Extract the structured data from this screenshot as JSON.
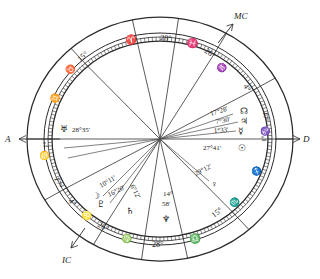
{
  "chart": {
    "kind": "astrological-natal-chart",
    "style": "hand-drawn-ink",
    "title": "",
    "axes": [
      {
        "id": "ascendant",
        "label": "A",
        "side": "left",
        "arrow": "left"
      },
      {
        "id": "descendant",
        "label": "D",
        "side": "right",
        "arrow": "right"
      },
      {
        "id": "midheaven",
        "label": "MC",
        "side": "upper-right",
        "arrow": "up-right"
      },
      {
        "id": "imum-coeli",
        "label": "IC",
        "side": "lower-left",
        "arrow": "down-left"
      }
    ],
    "house_cusps": [
      {
        "house": 1,
        "degree": "1°",
        "sign_glyph": "♋",
        "sign_name": "Cancer"
      },
      {
        "house": 2,
        "degree": "17°",
        "sign_glyph": "♌",
        "sign_name": "Leo"
      },
      {
        "house": 3,
        "degree": "4°",
        "sign_glyph": "♌",
        "sign_name": "Leo"
      },
      {
        "house": 4,
        "degree": "26°",
        "sign_glyph": "♍",
        "sign_name": "Virgo"
      },
      {
        "house": 5,
        "degree": "28°",
        "sign_glyph": "♎",
        "sign_name": "Libra"
      },
      {
        "house": 6,
        "degree": "15°",
        "sign_glyph": "♏",
        "sign_name": "Scorpio"
      },
      {
        "house": 7,
        "degree": "1°",
        "sign_glyph": "♑",
        "sign_name": "Capricorn"
      },
      {
        "house": 8,
        "degree": "17°",
        "sign_glyph": "♑",
        "sign_name": "Capricorn"
      },
      {
        "house": 9,
        "degree": "4°",
        "sign_glyph": "♒",
        "sign_name": "Aquarius"
      },
      {
        "house": 10,
        "degree": "26°",
        "sign_glyph": "♒",
        "sign_name": "Aquarius"
      },
      {
        "house": 11,
        "degree": "28°",
        "sign_glyph": "♓",
        "sign_name": "Pisces"
      },
      {
        "house": 12,
        "degree": "15°",
        "sign_glyph": "♉",
        "sign_name": "Taurus"
      }
    ],
    "wheel_sign_glyphs": [
      {
        "glyph": "♈",
        "name": "Aries"
      },
      {
        "glyph": "♓",
        "name": "Pisces"
      },
      {
        "glyph": "♒",
        "name": "Aquarius"
      },
      {
        "glyph": "♑",
        "name": "Capricorn"
      },
      {
        "glyph": "♐",
        "name": "Sagittarius"
      },
      {
        "glyph": "♏",
        "name": "Scorpio"
      },
      {
        "glyph": "♎",
        "name": "Libra"
      },
      {
        "glyph": "♍",
        "name": "Virgo"
      },
      {
        "glyph": "♌",
        "name": "Leo"
      },
      {
        "glyph": "♋",
        "name": "Cancer"
      },
      {
        "glyph": "♊",
        "name": "Gemini"
      },
      {
        "glyph": "♉",
        "name": "Taurus"
      }
    ],
    "planets": [
      {
        "id": "uranus",
        "glyph": "♅",
        "name": "Uranus",
        "position": "28°35'"
      },
      {
        "id": "node",
        "glyph": "☊",
        "name": "North Node",
        "position": "17°28'"
      },
      {
        "id": "jupiter",
        "glyph": "♃",
        "name": "Jupiter",
        "position": "7°30'"
      },
      {
        "id": "mercury",
        "glyph": "☿",
        "name": "Mercury",
        "position": "1°33'"
      },
      {
        "id": "sun",
        "glyph": "☉",
        "name": "Sun",
        "position": "27°41'"
      },
      {
        "id": "venus",
        "glyph": "♀",
        "name": "Venus",
        "position": "29°12'"
      },
      {
        "id": "neptune",
        "glyph": "♆",
        "name": "Neptune",
        "position": "14°58'"
      },
      {
        "id": "saturn",
        "glyph": "♄",
        "name": "Saturn",
        "position": "6°12'"
      },
      {
        "id": "pluto",
        "glyph": "♇",
        "name": "Pluto",
        "position": "16°20'"
      },
      {
        "id": "moon",
        "glyph": "☽",
        "name": "Moon",
        "position": "10°11'"
      }
    ],
    "labels": {
      "uranus_deg": "28°35'",
      "node_deg": "17°28'",
      "jupiter_deg": "7°30'",
      "mercury_deg": "1°33'",
      "sun_deg": "27°41'",
      "venus_deg": "29°12'",
      "neptune_deg_a": "14°",
      "neptune_deg_b": "58'",
      "saturn_deg": "6°12'",
      "pluto_deg": "16°20'",
      "moon_deg": "10°11'"
    },
    "colors": {
      "ink": "#2b2b2b",
      "paper": "#ffffff",
      "aspect_line": "#4a4a4a"
    }
  }
}
